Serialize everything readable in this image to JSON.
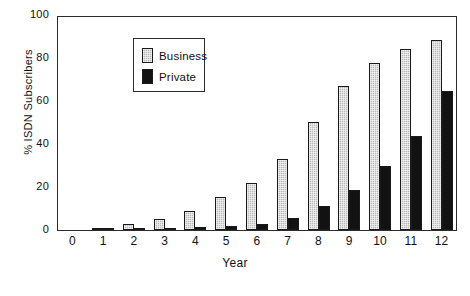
{
  "chart_data": {
    "type": "bar",
    "title": "",
    "xlabel": "Year",
    "ylabel": "% ISDN Subscribers",
    "categories": [
      "0",
      "1",
      "2",
      "3",
      "4",
      "5",
      "6",
      "7",
      "8",
      "9",
      "10",
      "11",
      "12"
    ],
    "series": [
      {
        "name": "Business",
        "color": "#b9b9b9",
        "values": [
          0,
          1,
          3,
          5,
          9,
          15.5,
          22,
          33.5,
          50.5,
          67.5,
          78.5,
          85,
          89
        ]
      },
      {
        "name": "Private",
        "color": "#121212",
        "values": [
          0,
          0.2,
          0.3,
          0.8,
          1.5,
          1.8,
          3,
          5.5,
          11.5,
          19,
          30,
          44,
          65.5
        ]
      }
    ],
    "ylim": [
      0,
      100
    ],
    "yticks": [
      0,
      20,
      40,
      60,
      80,
      100
    ],
    "ytick_labels": [
      "0",
      "20",
      "40",
      "60",
      "80",
      "100"
    ],
    "xtick_labels": [
      "0",
      "1",
      "2",
      "3",
      "4",
      "5",
      "6",
      "7",
      "8",
      "9",
      "10",
      "11",
      "12"
    ],
    "grid": false,
    "legend_position": "upper-center-left",
    "legend_entries": [
      "Business",
      "Private"
    ]
  },
  "legend": {
    "business_label": "Business",
    "private_label": "Private"
  },
  "axes": {
    "x_title": "Year",
    "y_title": "% ISDN Subscribers"
  }
}
